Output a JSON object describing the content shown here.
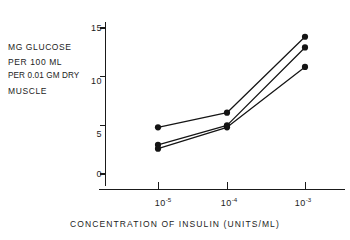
{
  "chart_data": {
    "type": "line",
    "title": "",
    "subtitle": "",
    "xlabel": "CONCENTRATION OF INSULIN (UNITS/ML)",
    "ylabel": "MG GLUCOSE PER 100 ML PER 0.01 GM DRY MUSCLE",
    "ylabel_lines": [
      "MG GLUCOSE",
      "PER  100 ML",
      "PER 0.01 GM DRY",
      "MUSCLE"
    ],
    "x_scale": "log",
    "x": [
      1e-05,
      0.0001,
      0.001
    ],
    "categories": [
      "10⁻⁵",
      "10⁻⁴",
      "10⁻³"
    ],
    "xtick_labels": [
      {
        "mantissa": "10",
        "exponent": "-5"
      },
      {
        "mantissa": "10",
        "exponent": "-4"
      },
      {
        "mantissa": "10",
        "exponent": "-3"
      }
    ],
    "ylim": [
      0,
      15
    ],
    "yticks": [
      0,
      5,
      10,
      15
    ],
    "ytick_labels": [
      "0",
      "5",
      "10",
      "15"
    ],
    "grid": false,
    "legend": false,
    "legend_position": "none",
    "marker": "filled-circle",
    "series": [
      {
        "name": "series-1",
        "values": [
          4.8,
          6.3,
          14.1
        ]
      },
      {
        "name": "series-2",
        "values": [
          3.0,
          5.0,
          13.0
        ]
      },
      {
        "name": "series-3",
        "values": [
          2.6,
          4.8,
          11.0
        ]
      }
    ],
    "annotations": [],
    "colors": {
      "ink": "#141414",
      "background": "#ffffff"
    }
  },
  "axis": {
    "y_tick_count": 4,
    "x_tick_count": 3
  }
}
